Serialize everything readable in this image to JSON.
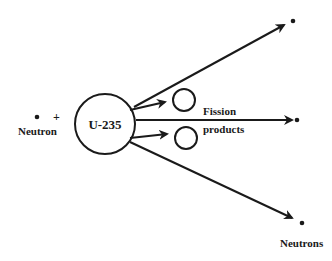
{
  "diagram": {
    "title": "",
    "colors": {
      "stroke": "#1a1a1a",
      "background": "#ffffff"
    },
    "incoming": {
      "label": "Neutron",
      "plus": "+"
    },
    "nucleus": {
      "label": "U-235"
    },
    "fission_products": {
      "label_line1": "Fission",
      "label_line2": "products"
    },
    "outgoing": {
      "label": "Neutrons",
      "count": 3
    }
  }
}
